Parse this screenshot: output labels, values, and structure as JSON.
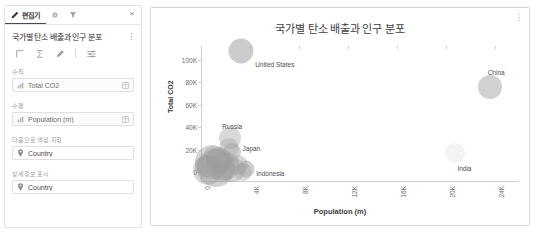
{
  "editor": {
    "tabs": [
      {
        "label": "편집기",
        "icon": "pencil-icon",
        "active": true
      },
      {
        "label": "",
        "icon": "gear-icon",
        "active": false
      },
      {
        "label": "",
        "icon": "funnel-icon",
        "active": false
      }
    ],
    "close_label": "×",
    "chart_name": "국가별 탄소 배출과 인구 분포",
    "kebab_label": "⋮",
    "toolbar": [
      {
        "name": "axes-icon",
        "glyph": "⌐"
      },
      {
        "name": "sigma-icon",
        "glyph": "Σ"
      },
      {
        "name": "brush-icon",
        "glyph": "✎"
      },
      {
        "name": "sliders-icon",
        "glyph": "≋"
      }
    ],
    "fields": [
      {
        "label": "수직",
        "value": "Total CO2",
        "icon": "measure-icon",
        "end_icon": "table-icon"
      },
      {
        "label": "수평",
        "value": "Population (m)",
        "icon": "measure-icon",
        "end_icon": "table-icon"
      },
      {
        "label": "다음으로 색상 지정",
        "value": "Country",
        "icon": "pin-icon",
        "end_icon": ""
      },
      {
        "label": "상세정보 표시",
        "value": "Country",
        "icon": "pin-icon",
        "end_icon": ""
      }
    ]
  },
  "chart_panel": {
    "kebab_label": "⋮"
  },
  "chart_data": {
    "type": "scatter",
    "title": "국가별 탄소 배출과 인구 분포",
    "xlabel": "Population (m)",
    "ylabel": "Total CO2",
    "xlim": [
      0,
      26000
    ],
    "ylim": [
      -8000,
      112000
    ],
    "xticks": [
      0,
      4000,
      8000,
      12000,
      16000,
      20000,
      24000
    ],
    "xticklabels": [
      "0",
      "4K",
      "8K",
      "12K",
      "16K",
      "20K",
      "24K"
    ],
    "yticks": [
      0,
      20000,
      40000,
      60000,
      80000,
      100000
    ],
    "yticklabels": [
      "0",
      "20K",
      "40K",
      "60K",
      "80K",
      "100K"
    ],
    "grid": false,
    "legend": "none",
    "bubble_color": "#9a9a9a",
    "points": [
      {
        "label": "United States",
        "x": 3300,
        "y": 108000,
        "size": 12.5,
        "opacity": 0.5,
        "label_dx": 14,
        "label_dy": 10
      },
      {
        "label": "China",
        "x": 23600,
        "y": 76000,
        "size": 12,
        "opacity": 0.45,
        "label_dx": -2,
        "label_dy": -18
      },
      {
        "label": "Russia",
        "x": 2400,
        "y": 30000,
        "size": 11,
        "opacity": 0.38,
        "label_dx": -8,
        "label_dy": -15
      },
      {
        "label": "Japan",
        "x": 2500,
        "y": 17500,
        "size": 9,
        "opacity": 0.4,
        "label_dx": 11,
        "label_dy": -7
      },
      {
        "label": "Indonesia",
        "x": 3700,
        "y": 2500,
        "size": 8.5,
        "opacity": 0.45,
        "label_dx": 10,
        "label_dy": 1
      },
      {
        "label": "India",
        "x": 20800,
        "y": 17000,
        "size": 10,
        "opacity": 0.12,
        "label_dx": 2,
        "label_dy": 12
      },
      {
        "label": "",
        "x": 900,
        "y": 9000,
        "size": 17,
        "opacity": 0.42
      },
      {
        "label": "",
        "x": 1500,
        "y": 11000,
        "size": 13,
        "opacity": 0.45
      },
      {
        "label": "",
        "x": 1200,
        "y": 3500,
        "size": 19,
        "opacity": 0.45
      },
      {
        "label": "",
        "x": 600,
        "y": 1500,
        "size": 15,
        "opacity": 0.4
      },
      {
        "label": "",
        "x": 2000,
        "y": 5500,
        "size": 14,
        "opacity": 0.42
      },
      {
        "label": "",
        "x": 2600,
        "y": 2000,
        "size": 12,
        "opacity": 0.4
      },
      {
        "label": "",
        "x": 1700,
        "y": 500,
        "size": 11,
        "opacity": 0.4
      },
      {
        "label": "",
        "x": 3050,
        "y": 6500,
        "size": 10,
        "opacity": 0.38
      },
      {
        "label": "",
        "x": 2300,
        "y": 21500,
        "size": 10,
        "opacity": 0.35
      },
      {
        "label": "",
        "x": 1000,
        "y": 15500,
        "size": 9,
        "opacity": 0.35
      },
      {
        "label": "",
        "x": 400,
        "y": 5500,
        "size": 11,
        "opacity": 0.38
      },
      {
        "label": "",
        "x": 3400,
        "y": 400,
        "size": 9,
        "opacity": 0.35
      }
    ]
  }
}
